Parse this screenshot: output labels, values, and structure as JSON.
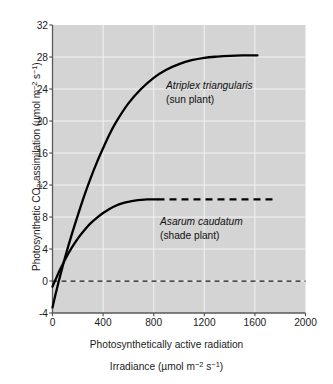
{
  "chart_data": {
    "type": "line",
    "title": "",
    "xlabel_line1": "Photosynthetically active radiation",
    "xlabel_line2_prefix": "Irradiance (µmol m",
    "xlabel_line2_sup1": "−2",
    "xlabel_line2_mid": " s",
    "xlabel_line2_sup2": "−1",
    "xlabel_line2_suffix": ")",
    "ylabel_part1": "Photosynthetic CO",
    "ylabel_sub": "2",
    "ylabel_part2": " assimilation (µmol m",
    "ylabel_sup1": "−2",
    "ylabel_part3": " s",
    "ylabel_sup2": "−1",
    "ylabel_part4": ")",
    "xlim": [
      0,
      2000
    ],
    "ylim": [
      -4,
      32
    ],
    "xticks": [
      0,
      400,
      800,
      1200,
      1600,
      2000
    ],
    "yticks": [
      -4,
      0,
      4,
      8,
      12,
      16,
      20,
      24,
      28,
      32
    ],
    "grid": true,
    "grid_color": "#f2f2f2",
    "plot_background": "#d4d4d4",
    "line_color": "#000000",
    "zero_line": {
      "value": 0,
      "style": "dashed",
      "x_from": 0,
      "x_to": 2000
    },
    "series": [
      {
        "name": "Atriplex triangularis",
        "common_name": "(sun plant)",
        "label_line1": "Atriplex triangularis",
        "label_line2": "(sun plant)",
        "style": "solid",
        "light_compensation_point": 40,
        "dark_respiration": -3.3,
        "saturation_value": 28.2,
        "x": [
          0,
          25,
          50,
          75,
          100,
          150,
          200,
          250,
          300,
          350,
          400,
          450,
          500,
          600,
          700,
          800,
          900,
          1000,
          1100,
          1200,
          1300,
          1400,
          1500,
          1620
        ],
        "y": [
          -3.3,
          -1.6,
          0.0,
          1.5,
          3.0,
          5.7,
          8.2,
          10.6,
          12.8,
          14.8,
          16.6,
          18.3,
          19.8,
          22.2,
          24.0,
          25.4,
          26.4,
          27.1,
          27.6,
          27.9,
          28.05,
          28.15,
          28.2,
          28.2
        ]
      },
      {
        "name": "Asarum caudatum",
        "common_name": "(shade plant)",
        "label_line1": "Asarum caudatum",
        "label_line2": "(shade plant)",
        "style": "solid-then-dashed",
        "dashed_from_x": 830,
        "dashed_to_x": 1740,
        "light_compensation_point": 18,
        "dark_respiration": -0.7,
        "saturation_value": 10.2,
        "x": [
          0,
          25,
          50,
          75,
          100,
          150,
          200,
          250,
          300,
          350,
          400,
          450,
          500,
          550,
          600,
          650,
          700,
          750,
          830
        ],
        "y": [
          -0.7,
          0.2,
          1.1,
          1.9,
          2.7,
          4.1,
          5.3,
          6.3,
          7.2,
          7.9,
          8.5,
          9.0,
          9.4,
          9.7,
          9.9,
          10.05,
          10.15,
          10.2,
          10.2
        ]
      }
    ]
  },
  "axis": {
    "y_tick_labels": [
      "32",
      "28",
      "24",
      "20",
      "16",
      "12",
      "8",
      "4",
      "0",
      "-4"
    ],
    "y_tick_values": [
      32,
      28,
      24,
      20,
      16,
      12,
      8,
      4,
      0,
      -4
    ],
    "x_tick_labels": [
      "0",
      "400",
      "800",
      "1200",
      "1600",
      "2000"
    ],
    "x_tick_values": [
      0,
      400,
      800,
      1200,
      1600,
      2000
    ]
  }
}
